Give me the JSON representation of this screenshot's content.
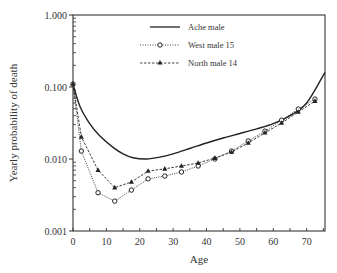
{
  "chart_data": {
    "type": "line",
    "title": "",
    "xlabel": "Age",
    "ylabel": "Yearly probability of death",
    "yscale": "log",
    "xlim": [
      0,
      75.5
    ],
    "ylim": [
      0.001,
      1.0
    ],
    "x_ticks": [
      0,
      10,
      20,
      30,
      40,
      50,
      60,
      70
    ],
    "x_tick_labels": [
      "0",
      "10",
      "20",
      "30",
      "40",
      "50",
      "60",
      "70"
    ],
    "y_ticks": [
      0.001,
      0.01,
      0.1,
      1.0
    ],
    "y_tick_labels": [
      "0.001",
      "0.010",
      "0.100",
      "1.000"
    ],
    "grid": false,
    "legend_position": "upper center",
    "series": [
      {
        "name": "Ache male",
        "style": "solid",
        "marker": "none",
        "x": [
          0,
          2,
          5,
          8,
          12,
          15,
          18,
          22,
          26,
          30,
          35,
          40,
          45,
          50,
          55,
          60,
          65,
          70,
          75.5
        ],
        "values": [
          0.11,
          0.055,
          0.031,
          0.021,
          0.0145,
          0.0118,
          0.0104,
          0.01,
          0.0106,
          0.0118,
          0.014,
          0.0167,
          0.0196,
          0.0226,
          0.0262,
          0.031,
          0.04,
          0.06,
          0.16
        ]
      },
      {
        "name": "West male 15",
        "style": "dotted",
        "marker": "open-circle",
        "x": [
          0,
          2.5,
          7.5,
          12.5,
          17.5,
          22.5,
          27.5,
          32.5,
          37.5,
          42.5,
          47.5,
          52.5,
          57.5,
          62.5,
          67.5,
          72.5
        ],
        "values": [
          0.11,
          0.0129,
          0.0034,
          0.0026,
          0.0037,
          0.0053,
          0.0058,
          0.0066,
          0.008,
          0.01,
          0.0129,
          0.0178,
          0.0244,
          0.0346,
          0.0494,
          0.0681
        ]
      },
      {
        "name": "North male 14",
        "style": "dashed",
        "marker": "filled-triangle",
        "x": [
          0,
          2.5,
          7.5,
          12.5,
          17.5,
          22.5,
          27.5,
          32.5,
          37.5,
          42.5,
          47.5,
          52.5,
          57.5,
          62.5,
          67.5,
          72.5
        ],
        "values": [
          0.11,
          0.0203,
          0.007,
          0.004,
          0.0048,
          0.0068,
          0.0073,
          0.008,
          0.0088,
          0.0103,
          0.0125,
          0.0167,
          0.0231,
          0.0316,
          0.045,
          0.0637
        ]
      }
    ]
  },
  "plot": {
    "left": 73,
    "right": 325,
    "top": 15,
    "bottom": 231
  },
  "legend": {
    "items": [
      {
        "label": "Ache male"
      },
      {
        "label": "West male 15"
      },
      {
        "label": "North male 14"
      }
    ]
  }
}
